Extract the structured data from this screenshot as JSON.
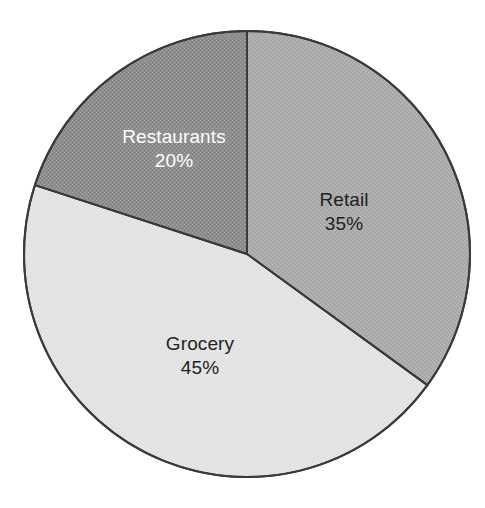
{
  "chart_data": {
    "type": "pie",
    "title": "",
    "subtitle": "",
    "xlabel": "",
    "ylabel": "",
    "legend": "none",
    "grid": false,
    "start_angle_deg": 0,
    "direction": "clockwise",
    "total": 100,
    "units": "%",
    "categories": [
      "Retail",
      "Grocery",
      "Restaurants"
    ],
    "values": [
      35,
      45,
      20
    ],
    "slices": [
      {
        "label": "Retail",
        "value": 35,
        "value_text": "35%",
        "color": "#ababab",
        "text_color": "#222222",
        "start_deg": 0,
        "end_deg": 126,
        "label_x": 344,
        "label_y": 212
      },
      {
        "label": "Grocery",
        "value": 45,
        "value_text": "45%",
        "color": "#e4e4e4",
        "text_color": "#222222",
        "start_deg": 126,
        "end_deg": 288,
        "label_x": 200,
        "label_y": 356
      },
      {
        "label": "Restaurants",
        "value": 20,
        "value_text": "20%",
        "color": "#8c8c8c",
        "text_color": "#ffffff",
        "start_deg": 288,
        "end_deg": 360,
        "label_x": 174,
        "label_y": 149
      }
    ],
    "geometry": {
      "center_x": 247,
      "center_y": 254,
      "radius": 223
    },
    "style": {
      "background": "#ffffff",
      "stroke": "#3a3a3a",
      "stroke_width": 2
    }
  }
}
